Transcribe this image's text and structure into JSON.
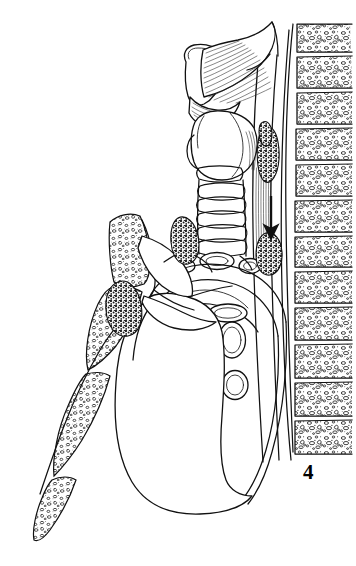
{
  "figure": {
    "number_label": "4",
    "label_x": 303,
    "label_y": 462,
    "caption_visible": false,
    "background_color": "#ffffff",
    "ink_color": "#111111",
    "width": 356,
    "height": 566,
    "style": "black-and-white line drawing / medical illustration",
    "view": "midsagittal section of neck and thorax"
  },
  "structures": {
    "vertebral_column": {
      "name": "vertebral column",
      "vertebra_count": 12,
      "fill_pattern": "trabecular-stipple",
      "x_left": 292,
      "x_right": 352,
      "y_top": 22,
      "y_bottom": 452
    },
    "spinal_canal": {
      "name": "spinal canal / anterior longitudinal ligament",
      "line_count": 2
    },
    "sternum": {
      "name": "sternum (manubrium, body, xiphoid)",
      "segments": 3,
      "fill_pattern": "trabecular-stipple"
    },
    "larynx": {
      "name": "larynx / hyoid with striated muscle",
      "hatch_lines": 26
    },
    "thyroid": {
      "name": "thyroid cartilage and gland"
    },
    "trachea": {
      "name": "trachea",
      "cartilage_rings": 7
    },
    "bronchi": {
      "name": "main bronchi in cross-section",
      "count": 3
    },
    "heart": {
      "name": "heart silhouette"
    },
    "aortic_arch": {
      "name": "aortic arch"
    },
    "pulmonary_vessels": {
      "name": "pulmonary vessels in cross-section",
      "count": 4
    },
    "lymph_nodes": {
      "name": "lymph nodes (stippled, dark)",
      "count": 5,
      "fill_pattern": "dense-stipple"
    },
    "esophagus": {
      "name": "esophagus / prevertebral fascia",
      "hatched": true
    },
    "arrow": {
      "name": "direction-of-drainage arrow",
      "direction": "down",
      "x": 271,
      "y_top": 196,
      "y_bottom": 238
    }
  }
}
